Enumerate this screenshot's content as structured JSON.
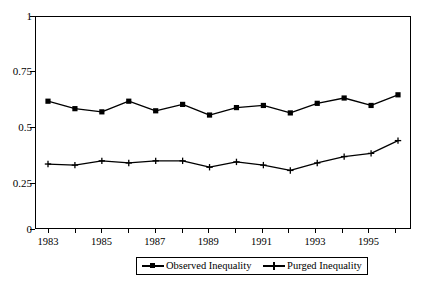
{
  "chart_data": {
    "type": "line",
    "title": "",
    "subtitle": "",
    "xlabel": "",
    "ylabel": "",
    "x": [
      1983,
      1984,
      1985,
      1986,
      1987,
      1988,
      1989,
      1990,
      1991,
      1992,
      1993,
      1994,
      1995,
      1996
    ],
    "xtick_labels": [
      "1983",
      "",
      "1985",
      "",
      "1987",
      "",
      "1989",
      "",
      "1991",
      "",
      "1993",
      "",
      "1995",
      ""
    ],
    "xtick_labels_shown": [
      "1983",
      "1985",
      "1987",
      "1989",
      "1991",
      "1993",
      "1995"
    ],
    "ytick_labels": [
      "0",
      "0.25",
      "0.5",
      "0.75",
      "1"
    ],
    "ytick_values": [
      0,
      0.25,
      0.5,
      0.75,
      1
    ],
    "ylim": [
      0,
      1
    ],
    "xlim": [
      1983,
      1996
    ],
    "grid": true,
    "grid_axis": "y",
    "legend_position": "bottom",
    "series": [
      {
        "name": "Observed Inequality",
        "marker": "square",
        "color": "#000000",
        "values": [
          0.6,
          0.565,
          0.55,
          0.6,
          0.555,
          0.585,
          0.535,
          0.57,
          0.58,
          0.545,
          0.59,
          0.615,
          0.58,
          0.63
        ]
      },
      {
        "name": "Purged Inequality",
        "marker": "plus",
        "color": "#000000",
        "values": [
          0.305,
          0.3,
          0.32,
          0.31,
          0.32,
          0.32,
          0.29,
          0.315,
          0.3,
          0.275,
          0.31,
          0.34,
          0.355,
          0.415
        ]
      }
    ]
  },
  "legend": {
    "items": [
      {
        "label": "Observed Inequality",
        "marker": "square"
      },
      {
        "label": "Purged Inequality",
        "marker": "plus"
      }
    ]
  },
  "axes": {
    "y_labels": [
      "1",
      "0.75",
      "0.5",
      "0.25",
      "0"
    ],
    "x_labels": [
      "1983",
      "1985",
      "1987",
      "1989",
      "1991",
      "1993",
      "1995"
    ]
  },
  "colors": {
    "ink": "#000000",
    "gridline": "#888888",
    "background": "#ffffff"
  }
}
